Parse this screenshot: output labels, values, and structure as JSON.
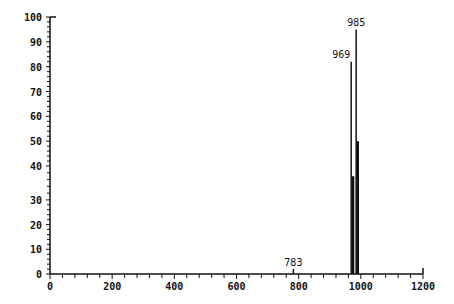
{
  "chart_data": {
    "type": "bar",
    "title": "",
    "xlabel": "",
    "ylabel": "",
    "xlim": [
      0,
      1200
    ],
    "ylim": [
      0,
      100
    ],
    "grid": false,
    "x_ticks": [
      "0",
      "200",
      "400",
      "600",
      "800",
      "1000",
      "1200"
    ],
    "y_ticks": [
      "0",
      "10",
      "20",
      "30",
      "40",
      "50",
      "60",
      "70",
      "80",
      "90",
      "100"
    ],
    "peaks": [
      {
        "x": 783,
        "y": 2,
        "label": "783"
      },
      {
        "x": 969,
        "y": 82,
        "label": "969"
      },
      {
        "x": 985,
        "y": 95,
        "label": "985"
      },
      {
        "x": 975,
        "y": 37,
        "label": ""
      },
      {
        "x": 990,
        "y": 50,
        "label": ""
      }
    ],
    "color": "#111111"
  }
}
